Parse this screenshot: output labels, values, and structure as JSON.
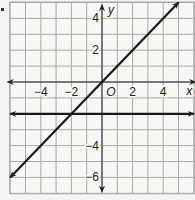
{
  "chart_data": {
    "type": "line",
    "title": "",
    "xlabel": "x",
    "ylabel": "y",
    "origin_label": "O",
    "xlim": [
      -6,
      6
    ],
    "ylim": [
      -7,
      5
    ],
    "grid": true,
    "grid_step": 1,
    "x_ticks": [
      {
        "value": -4,
        "label": "−4"
      },
      {
        "value": -2,
        "label": "−2"
      },
      {
        "value": 2,
        "label": "2"
      },
      {
        "value": 4,
        "label": "4"
      }
    ],
    "y_ticks": [
      {
        "value": 4,
        "label": "4"
      },
      {
        "value": 2,
        "label": "2"
      },
      {
        "value": -4,
        "label": "−4"
      },
      {
        "value": -6,
        "label": "−6"
      }
    ],
    "series": [
      {
        "name": "line y = x",
        "equation": "y = x",
        "points": [
          [
            -6,
            -6
          ],
          [
            5,
            5
          ]
        ],
        "arrows": "both"
      },
      {
        "name": "line y = -2",
        "equation": "y = -2",
        "points": [
          [
            -6,
            -2
          ],
          [
            6,
            -2
          ]
        ],
        "arrows": "both"
      }
    ],
    "intersection": [
      -2,
      -2
    ]
  },
  "colors": {
    "background": "#f4f4f2",
    "grid": "#a8a8a8",
    "axis": "#222222",
    "line": "#1a1a1a"
  }
}
